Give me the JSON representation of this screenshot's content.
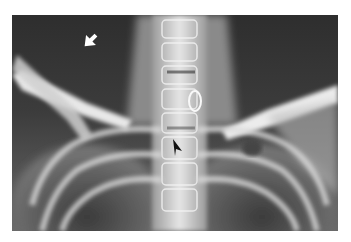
{
  "image": {
    "kind": "radiograph",
    "subject": "chest / cervicothoracic spine, frontal view",
    "colors": {
      "background": "#ffffff",
      "film_dark": "#2a2a2a",
      "bone_light": "#f2f2f2"
    },
    "annotations": [
      {
        "name": "white-arrow",
        "color": "#ffffff",
        "direction": "down-left"
      },
      {
        "name": "black-arrowhead",
        "color": "#111111",
        "direction": "down-right"
      }
    ]
  }
}
